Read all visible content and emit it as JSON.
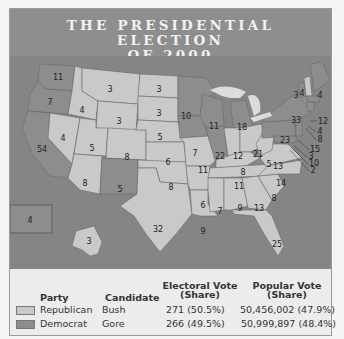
{
  "title": {
    "line1": "THE PRESIDENTIAL ELECTION",
    "line2": "OF 2000"
  },
  "colors": {
    "republican": "#c9c9c9",
    "democrat": "#8d8d8d",
    "water": "#858585",
    "banner": "#8e8e8e"
  },
  "map": {
    "states": [
      {
        "name": "WA",
        "ev": "11",
        "party": "democrat"
      },
      {
        "name": "OR",
        "ev": "7",
        "party": "democrat"
      },
      {
        "name": "CA",
        "ev": "54",
        "party": "democrat"
      },
      {
        "name": "NV",
        "ev": "4",
        "party": "republican"
      },
      {
        "name": "ID",
        "ev": "4",
        "party": "republican"
      },
      {
        "name": "MT",
        "ev": "3",
        "party": "republican"
      },
      {
        "name": "WY",
        "ev": "3",
        "party": "republican"
      },
      {
        "name": "UT",
        "ev": "5",
        "party": "republican"
      },
      {
        "name": "AZ",
        "ev": "8",
        "party": "republican"
      },
      {
        "name": "CO",
        "ev": "8",
        "party": "republican"
      },
      {
        "name": "NM",
        "ev": "5",
        "party": "democrat"
      },
      {
        "name": "ND",
        "ev": "3",
        "party": "republican"
      },
      {
        "name": "SD",
        "ev": "3",
        "party": "republican"
      },
      {
        "name": "NE",
        "ev": "5",
        "party": "republican"
      },
      {
        "name": "KS",
        "ev": "6",
        "party": "republican"
      },
      {
        "name": "OK",
        "ev": "8",
        "party": "republican"
      },
      {
        "name": "TX",
        "ev": "32",
        "party": "republican"
      },
      {
        "name": "MN",
        "ev": "10",
        "party": "democrat"
      },
      {
        "name": "IA",
        "ev": "7",
        "party": "democrat"
      },
      {
        "name": "MO",
        "ev": "11",
        "party": "republican"
      },
      {
        "name": "AR",
        "ev": "6",
        "party": "republican"
      },
      {
        "name": "LA",
        "ev": "9",
        "party": "republican"
      },
      {
        "name": "WI",
        "ev": "11",
        "party": "democrat"
      },
      {
        "name": "IL",
        "ev": "22",
        "party": "democrat"
      },
      {
        "name": "MI",
        "ev": "18",
        "party": "democrat"
      },
      {
        "name": "IN",
        "ev": "12",
        "party": "republican"
      },
      {
        "name": "OH",
        "ev": "21",
        "party": "republican"
      },
      {
        "name": "KY",
        "ev": "8",
        "party": "republican"
      },
      {
        "name": "TN",
        "ev": "11",
        "party": "republican"
      },
      {
        "name": "MS",
        "ev": "7",
        "party": "republican"
      },
      {
        "name": "AL",
        "ev": "9",
        "party": "republican"
      },
      {
        "name": "GA",
        "ev": "13",
        "party": "republican"
      },
      {
        "name": "FL",
        "ev": "25",
        "party": "republican"
      },
      {
        "name": "SC",
        "ev": "8",
        "party": "republican"
      },
      {
        "name": "NC",
        "ev": "14",
        "party": "republican"
      },
      {
        "name": "VA",
        "ev": "13",
        "party": "republican"
      },
      {
        "name": "WV",
        "ev": "5",
        "party": "republican"
      },
      {
        "name": "PA",
        "ev": "23",
        "party": "democrat"
      },
      {
        "name": "NY",
        "ev": "33",
        "party": "democrat"
      },
      {
        "name": "VT",
        "ev": "3",
        "party": "democrat"
      },
      {
        "name": "NH",
        "ev": "4",
        "party": "republican"
      },
      {
        "name": "ME",
        "ev": "4",
        "party": "democrat"
      },
      {
        "name": "MA",
        "ev": "12",
        "party": "democrat"
      },
      {
        "name": "RI",
        "ev": "4",
        "party": "democrat"
      },
      {
        "name": "CT",
        "ev": "8",
        "party": "democrat"
      },
      {
        "name": "NJ",
        "ev": "15",
        "party": "democrat"
      },
      {
        "name": "DE",
        "ev": "3",
        "party": "democrat"
      },
      {
        "name": "MD",
        "ev": "10",
        "party": "democrat"
      },
      {
        "name": "DC",
        "ev": "2",
        "party": "democrat"
      },
      {
        "name": "AK",
        "ev": "3",
        "party": "republican"
      },
      {
        "name": "HI",
        "ev": "4",
        "party": "democrat"
      }
    ]
  },
  "legend": {
    "headers": {
      "party": "Party",
      "candidate": "Candidate",
      "electoral_1": "Electoral Vote",
      "electoral_2": "(Share)",
      "popular_1": "Popular Vote",
      "popular_2": "(Share)"
    },
    "rows": [
      {
        "party": "Republican",
        "candidate": "Bush",
        "electoral": "271 (50.5%)",
        "popular": "50,456,002 (47.9%)"
      },
      {
        "party": "Democrat",
        "candidate": "Gore",
        "electoral": "266 (49.5%)",
        "popular": "50,999,897 (48.4%)"
      }
    ]
  }
}
